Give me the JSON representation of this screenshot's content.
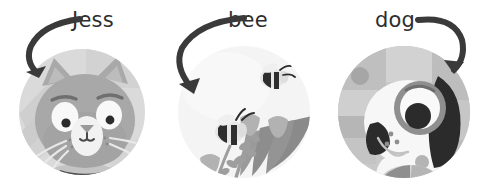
{
  "page": {
    "background_color": "#ffffff",
    "width": 482,
    "height": 190
  },
  "style": {
    "arrow_color": "#3a3a3a",
    "label_color": "#2e2e2e",
    "cat_circle_bg": "#d9d9d9",
    "cat_circle_bg_alt": "#cfcfcf",
    "cat_fur": "#a8a8a8",
    "cat_fur_dark": "#9a9a9a",
    "cat_eye_white": "#f7f7f7",
    "cat_eye_pupil": "#2b2b2b",
    "bee_circle_bg": "#f2f2f2",
    "bee_body": "#e0e0e0",
    "bee_stripe": "#2e2e2e",
    "leaf_dark": "#8c8c8c",
    "flower_gray": "#b0b0b0",
    "dog_circle_bg": "#c9c9c9",
    "dog_body_white": "#f7f7f7",
    "dog_patch_dark": "#2b2b2b",
    "dog_muzzle_gray": "#b4b4b4",
    "ball_light": "#d4d4d4",
    "ball_dark": "#8f8f8f"
  },
  "panels": [
    {
      "id": "cat",
      "label": "Jess",
      "icon": "cat-face-illustration",
      "label_x": 72,
      "label_y": 10,
      "arrow": "curved-arrow-down-left"
    },
    {
      "id": "bee",
      "label": "bee",
      "icon": "bees-and-flowers-illustration",
      "label_x": 228,
      "label_y": 10,
      "arrow": "curved-arrow-down-left"
    },
    {
      "id": "dog",
      "label": "dog",
      "icon": "dog-face-illustration",
      "label_x": 375,
      "label_y": 10,
      "arrow": "curved-arrow-down-right"
    }
  ]
}
